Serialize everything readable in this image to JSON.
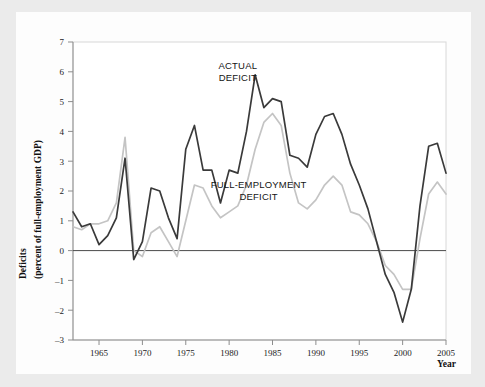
{
  "chart_data": {
    "type": "line",
    "title": "",
    "ylabel": "Deficits (percent of full-employment GDP)",
    "ylabel_line1": "Deficits",
    "ylabel_line2": "(percent of full-employment GDP)",
    "xlabel": "Year",
    "xlim": [
      1962,
      2005
    ],
    "ylim": [
      -3,
      7
    ],
    "yticks": [
      7,
      6,
      5,
      4,
      3,
      2,
      1,
      0,
      -1,
      -2,
      -3
    ],
    "ytick_labels": [
      "7",
      "6",
      "5",
      "4",
      "3",
      "2",
      "1",
      "0",
      "–1",
      "–2",
      "–3"
    ],
    "xticks": [
      1965,
      1970,
      1975,
      1980,
      1985,
      1990,
      1995,
      2000,
      2005
    ],
    "xtick_labels": [
      "1965",
      "1970",
      "1975",
      "1980",
      "1985",
      "1990",
      "1995",
      "2000",
      "2005"
    ],
    "grid": false,
    "legend_position": "inline-annotations",
    "zero_line": 0,
    "annotations": [
      {
        "name": "actual-deficit-label",
        "line1": "ACTUAL",
        "line2": "DEFICIT",
        "x": 1981.0,
        "y": 6.1
      },
      {
        "name": "full-employment-deficit-label",
        "line1": "FULL-EMPLOYMENT",
        "line2": "DEFICIT",
        "x": 1983.4,
        "y": 2.1
      }
    ],
    "x": [
      1962,
      1963,
      1964,
      1965,
      1966,
      1967,
      1968,
      1969,
      1970,
      1971,
      1972,
      1973,
      1974,
      1975,
      1976,
      1977,
      1978,
      1979,
      1980,
      1981,
      1982,
      1983,
      1984,
      1985,
      1986,
      1987,
      1988,
      1989,
      1990,
      1991,
      1992,
      1993,
      1994,
      1995,
      1996,
      1997,
      1998,
      1999,
      2000,
      2001,
      2002,
      2003,
      2004,
      2005
    ],
    "series": [
      {
        "name": "ACTUAL DEFICIT",
        "color": "#3a3a3a",
        "values": [
          1.3,
          0.8,
          0.9,
          0.2,
          0.5,
          1.1,
          3.1,
          -0.3,
          0.3,
          2.1,
          2.0,
          1.1,
          0.4,
          3.4,
          4.2,
          2.7,
          2.7,
          1.6,
          2.7,
          2.6,
          4.0,
          5.9,
          4.8,
          5.1,
          5.0,
          3.2,
          3.1,
          2.8,
          3.9,
          4.5,
          4.6,
          3.9,
          2.9,
          2.2,
          1.4,
          0.3,
          -0.8,
          -1.4,
          -2.4,
          -1.3,
          1.5,
          3.5,
          3.6,
          2.6
        ],
        "label_line1": "ACTUAL",
        "label_line2": "DEFICIT"
      },
      {
        "name": "FULL-EMPLOYMENT DEFICIT",
        "color": "#c4c4c4",
        "values": [
          0.8,
          0.7,
          0.9,
          0.9,
          1.0,
          1.6,
          3.8,
          0.0,
          -0.2,
          0.6,
          0.8,
          0.3,
          -0.2,
          1.0,
          2.2,
          2.1,
          1.5,
          1.1,
          1.3,
          1.5,
          2.2,
          3.4,
          4.3,
          4.6,
          4.2,
          2.6,
          1.6,
          1.4,
          1.7,
          2.2,
          2.5,
          2.2,
          1.3,
          1.2,
          0.9,
          0.3,
          -0.5,
          -0.8,
          -1.3,
          -1.3,
          0.4,
          1.9,
          2.3,
          1.9
        ],
        "label_line1": "FULL-EMPLOYMENT",
        "label_line2": "DEFICIT"
      }
    ]
  }
}
